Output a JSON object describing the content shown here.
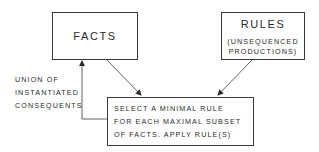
{
  "diagram": {
    "nodes": {
      "facts": {
        "label": "FACTS"
      },
      "rules": {
        "title": "RULES",
        "subtitle_line1": "(UNSEQUENCED",
        "subtitle_line2": "PRODUCTIONS)"
      },
      "select": {
        "line1": "SELECT A MINIMAL RULE",
        "line2": "FOR EACH MAXIMAL SUBSET",
        "line3": "OF FACTS. APPLY RULE(S)"
      }
    },
    "edges": [
      {
        "from": "facts",
        "to": "select"
      },
      {
        "from": "rules",
        "to": "select"
      },
      {
        "from": "select",
        "to": "facts",
        "label": "UNION OF INSTANTIATED CONSEQUENTS"
      }
    ],
    "feedback_label": {
      "line1": "UNION OF",
      "line2": "INSTANTIATED",
      "line3": "CONSEQUENTS"
    },
    "colors": {
      "line": "#3a3a3a",
      "background": "#ffffff"
    }
  }
}
